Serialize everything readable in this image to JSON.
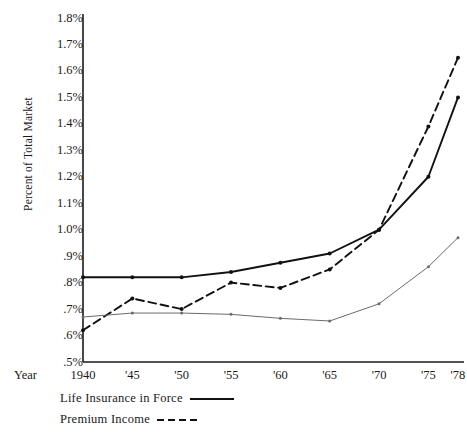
{
  "chart_data": {
    "type": "line",
    "title": "",
    "xlabel": "Year",
    "ylabel": "Percent of Total Market",
    "x": [
      1940,
      1945,
      1950,
      1955,
      1960,
      1965,
      1970,
      1975,
      1978
    ],
    "categories": [
      "1940",
      "'45",
      "'50",
      "'55",
      "'60",
      "'65",
      "'70",
      "'75",
      "'78"
    ],
    "ylim": [
      0.5,
      1.8
    ],
    "yticks": [
      0.5,
      0.6,
      0.7,
      0.8,
      0.9,
      1.0,
      1.1,
      1.2,
      1.3,
      1.4,
      1.5,
      1.6,
      1.7,
      1.8
    ],
    "ytick_labels": [
      ".5%",
      ".6%",
      ".7%",
      ".8%",
      ".9%",
      "1.0%",
      "1.1%",
      "1.2%",
      "1.3%",
      "1.4%",
      "1.5%",
      "1.6%",
      "1.7%",
      "1.8%"
    ],
    "grid": false,
    "legend_position": "below-left",
    "series": [
      {
        "name": "Life Insurance in Force",
        "style": "solid",
        "color": "#111111",
        "width": 1.9,
        "values": [
          0.82,
          0.82,
          0.82,
          0.84,
          0.875,
          0.91,
          1.0,
          1.2,
          1.5
        ]
      },
      {
        "name": "Premium Income",
        "style": "dashed",
        "color": "#111111",
        "width": 1.9,
        "values": [
          0.62,
          0.74,
          0.7,
          0.8,
          0.78,
          0.85,
          1.0,
          1.39,
          1.65
        ]
      },
      {
        "name": "",
        "style": "solid",
        "color": "#6b6b6b",
        "width": 1.0,
        "values": [
          0.67,
          0.685,
          0.685,
          0.68,
          0.665,
          0.655,
          0.72,
          0.86,
          0.97
        ]
      }
    ]
  },
  "legend": {
    "items": [
      {
        "label": "Life Insurance in Force",
        "style": "solid"
      },
      {
        "label": "Premium Income",
        "style": "dashed"
      }
    ]
  },
  "axes": {
    "y_title": "Percent of Total Market",
    "x_title": "Year"
  }
}
